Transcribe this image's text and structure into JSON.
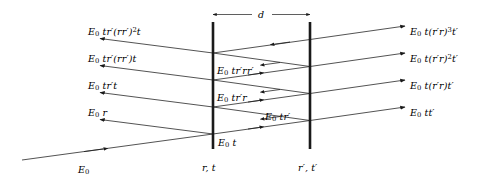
{
  "figure": {
    "ink_color": "#1a1a1a",
    "background_color": "#ffffff"
  },
  "dimension": {
    "label": "d",
    "description": "separation between the two surfaces"
  },
  "surfaces": [
    {
      "name": "left-surface",
      "label_html": "r, t",
      "coefficients": {
        "reflection": "r",
        "transmission": "t"
      },
      "x": 213
    },
    {
      "name": "right-surface",
      "label_html": "r′, t′",
      "coefficients": {
        "reflection": "r′",
        "transmission": "t′"
      },
      "x": 310
    }
  ],
  "incident": {
    "label_html": "E<sub>0</sub>",
    "name": "incident-beam"
  },
  "reflected_rays": [
    {
      "id": "r4",
      "label_html": "E<sub>0</sub> tr′(rr′)<sup>2</sup>t",
      "order": 4
    },
    {
      "id": "r3",
      "label_html": "E<sub>0</sub> tr′(rr′)t",
      "order": 3
    },
    {
      "id": "r2",
      "label_html": "E<sub>0</sub> tr′t",
      "order": 2
    },
    {
      "id": "r1",
      "label_html": "E<sub>0</sub> r",
      "order": 1
    }
  ],
  "transmitted_rays": [
    {
      "id": "t4",
      "label_html": "E<sub>0</sub> t(r′r)<sup>3</sup>t′",
      "order": 4
    },
    {
      "id": "t3",
      "label_html": "E<sub>0</sub> t(r′r)<sup>2</sup>t′",
      "order": 3
    },
    {
      "id": "t2",
      "label_html": "E<sub>0</sub> t(r′r)t′",
      "order": 2
    },
    {
      "id": "t1",
      "label_html": "E<sub>0</sub> tt′",
      "order": 1
    }
  ],
  "internal_rays": [
    {
      "id": "i4",
      "label_html": "E<sub>0</sub> tr′rr′"
    },
    {
      "id": "i3",
      "label_html": "E<sub>0</sub> tr′r"
    },
    {
      "id": "i2",
      "label_html": "E<sub>0</sub> tr′"
    },
    {
      "id": "i1",
      "label_html": "E<sub>0</sub> t"
    }
  ]
}
